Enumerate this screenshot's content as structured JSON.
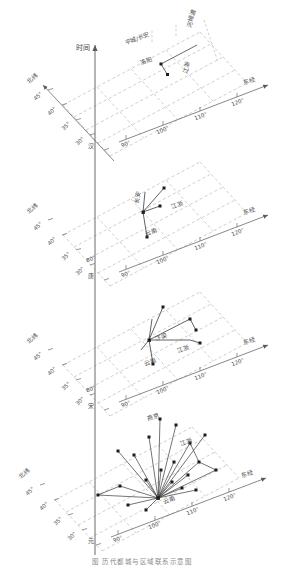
{
  "figure": {
    "caption": "图 历代都城与区域联系示意图",
    "axes": {
      "time_axis_label": "时间",
      "latitude_axis_label": "北纬",
      "longitude_axis_label": "东经",
      "latitude_ticks": [
        "45°",
        "40°",
        "35°",
        "30°",
        "25°"
      ],
      "longitude_ticks": [
        "80°",
        "90°",
        "100°",
        "110°",
        "120°"
      ]
    },
    "grid": {
      "style": "dashed",
      "color": "#9aa0a6",
      "panels": 4
    },
    "colors": {
      "grid": "#9aa0a6",
      "axis": "#6b6b6b",
      "marker": "#1c1c1c",
      "link": "#3a3a3a",
      "label": "#4a4a4a"
    },
    "panels": [
      {
        "index": 0,
        "era": "汉",
        "capital": "洛阳",
        "region_labels": [
          "平城/长安",
          "洛阳",
          "江浙",
          "河姆渡"
        ],
        "node_count": 2
      },
      {
        "index": 1,
        "era": "唐",
        "capital": "长安",
        "region_labels": [
          "长安",
          "江浙",
          "云南"
        ],
        "node_count": 4
      },
      {
        "index": 2,
        "era": "宋",
        "capital": "汴梁",
        "region_labels": [
          "汴梁",
          "江浙",
          "云南"
        ],
        "node_count": 6
      },
      {
        "index": 3,
        "era": "元",
        "capital": "燕京",
        "region_labels": [
          "燕京",
          "江浙",
          "云南"
        ],
        "node_count": 20
      }
    ],
    "markers": {
      "shape": "square",
      "size_px": 3
    }
  }
}
